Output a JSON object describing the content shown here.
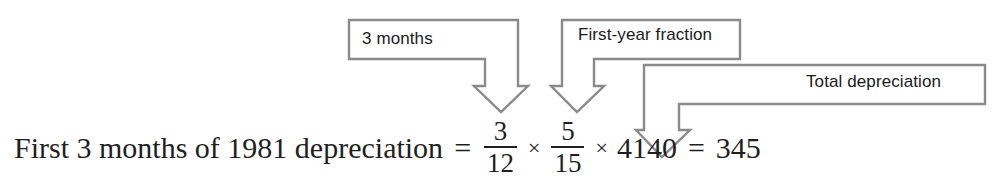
{
  "figure": {
    "kind": "annotated-formula",
    "line_color": "#8a8a8a",
    "text_color": "#1a1a1a",
    "equation_color": "#1f1f1f",
    "background": "#ffffff"
  },
  "callouts": [
    {
      "id": "three-months",
      "label": "3 months",
      "points_to": "3/12 fraction"
    },
    {
      "id": "first-year-fraction",
      "label": "First-year fraction",
      "points_to": "5/15 fraction"
    },
    {
      "id": "total-depreciation",
      "label": "Total depreciation",
      "points_to": "4140"
    }
  ],
  "equation": {
    "lead_text": "First 3 months of 1981 depreciation",
    "equals": "=",
    "fraction_1": {
      "numerator": "3",
      "denominator": "12"
    },
    "times_1": "×",
    "fraction_2": {
      "numerator": "5",
      "denominator": "15"
    },
    "times_2": "×",
    "factor": "4140",
    "equals_2": "=",
    "result": "345"
  }
}
